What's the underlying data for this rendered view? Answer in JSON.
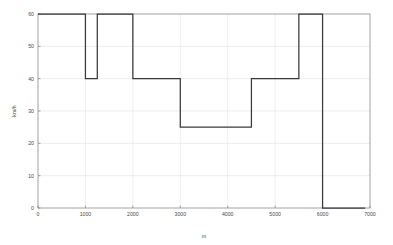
{
  "chart_data": {
    "type": "line",
    "title": "",
    "xlabel": "m",
    "ylabel": "km/h",
    "xlim": [
      0,
      7000
    ],
    "ylim": [
      0,
      60
    ],
    "grid": true,
    "legend": "none",
    "line_style": "step-post",
    "line_color": "#3a3a3a",
    "xticks": [
      0,
      1000,
      2000,
      3000,
      4000,
      5000,
      6000,
      7000
    ],
    "xticklabels": [
      "0",
      "1000",
      "2000",
      "3000",
      "4000",
      "5000",
      "6000",
      "7000"
    ],
    "yticks": [
      0,
      10,
      20,
      30,
      40,
      50,
      60
    ],
    "yticklabels": [
      "0",
      "10",
      "20",
      "30",
      "40",
      "50",
      "60"
    ],
    "series": [
      {
        "name": "speed limit",
        "x": [
          0,
          1000,
          1000,
          1250,
          1250,
          2000,
          2000,
          3000,
          3000,
          4500,
          4500,
          5500,
          5500,
          6000,
          6000,
          6900
        ],
        "y": [
          60,
          60,
          40,
          40,
          60,
          60,
          40,
          40,
          25,
          25,
          40,
          40,
          60,
          60,
          0,
          0
        ]
      }
    ],
    "segments": [
      {
        "x_start": 0,
        "x_end": 1000,
        "value": 60
      },
      {
        "x_start": 1000,
        "x_end": 1250,
        "value": 40
      },
      {
        "x_start": 1250,
        "x_end": 2000,
        "value": 60
      },
      {
        "x_start": 2000,
        "x_end": 3000,
        "value": 40
      },
      {
        "x_start": 3000,
        "x_end": 4500,
        "value": 25
      },
      {
        "x_start": 4500,
        "x_end": 5500,
        "value": 40
      },
      {
        "x_start": 5500,
        "x_end": 6000,
        "value": 60
      },
      {
        "x_start": 6000,
        "x_end": 6900,
        "value": 0
      }
    ]
  },
  "axes": {
    "xlabel": "m",
    "ylabel": "km/h"
  }
}
